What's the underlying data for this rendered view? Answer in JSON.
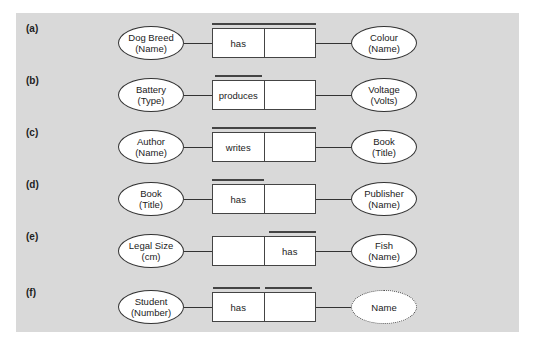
{
  "diagram": {
    "background_color": "#d9d9d9",
    "rows": [
      {
        "label": "(a)",
        "left_entity": {
          "name": "Dog Breed",
          "ref": "(Name)"
        },
        "roles": [
          "has",
          ""
        ],
        "right_entity": {
          "name": "Colour",
          "ref": "(Name)",
          "value_type": false
        },
        "uniqueness": "both"
      },
      {
        "label": "(b)",
        "left_entity": {
          "name": "Battery",
          "ref": "(Type)"
        },
        "roles": [
          "produces",
          ""
        ],
        "right_entity": {
          "name": "Voltage",
          "ref": "(Volts)",
          "value_type": false
        },
        "uniqueness": "left"
      },
      {
        "label": "(c)",
        "left_entity": {
          "name": "Author",
          "ref": "(Name)"
        },
        "roles": [
          "writes",
          ""
        ],
        "right_entity": {
          "name": "Book",
          "ref": "(Title)",
          "value_type": false
        },
        "uniqueness": "both"
      },
      {
        "label": "(d)",
        "left_entity": {
          "name": "Book",
          "ref": "(Title)"
        },
        "roles": [
          "has",
          ""
        ],
        "right_entity": {
          "name": "Publisher",
          "ref": "(Name)",
          "value_type": false
        },
        "uniqueness": "left"
      },
      {
        "label": "(e)",
        "left_entity": {
          "name": "Legal Size",
          "ref": "(cm)"
        },
        "roles": [
          "",
          "has"
        ],
        "right_entity": {
          "name": "Fish",
          "ref": "(Name)",
          "value_type": false
        },
        "uniqueness": "right"
      },
      {
        "label": "(f)",
        "left_entity": {
          "name": "Student",
          "ref": "(Number)"
        },
        "roles": [
          "has",
          ""
        ],
        "right_entity": {
          "name": "Name",
          "ref": "",
          "value_type": true
        },
        "uniqueness": "each"
      }
    ]
  }
}
